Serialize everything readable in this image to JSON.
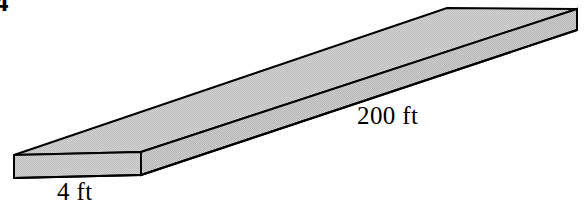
{
  "figure": {
    "kind": "rectangular-prism-slab",
    "projection": "oblique",
    "problem_number": "4",
    "labels": {
      "length": "200 ft",
      "width": "4 ft"
    },
    "colors": {
      "background": "#ffffff",
      "face_top_fill": "#c9c9c9",
      "face_side_fill": "#c4c4c4",
      "face_end_fill": "#c9c9c9",
      "outline": "#000000",
      "text": "#000000"
    },
    "geometry": {
      "outline_width": 2,
      "top_face": "14,155 447,8 577,9 141,152",
      "front_side_face": "14,155 141,152 141,175 14,178",
      "long_side_face": "141,152 577,9 577,30 141,175",
      "vertices": {
        "near_left_top_back": [
          14,
          155
        ],
        "near_left_top_front": [
          141,
          152
        ],
        "near_left_bottom_back": [
          14,
          178
        ],
        "near_left_bottom_front": [
          141,
          175
        ],
        "far_right_top_back": [
          447,
          8
        ],
        "far_right_top_front": [
          577,
          9
        ],
        "far_right_bottom_front": [
          577,
          30
        ]
      }
    }
  }
}
